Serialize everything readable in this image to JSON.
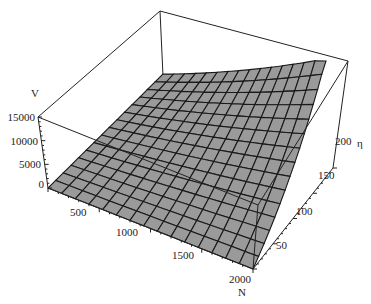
{
  "chart_data": {
    "type": "surface3d",
    "title": "",
    "xlabel": "N",
    "ylabel": "η",
    "zlabel": "V",
    "x_ticks": [
      "500",
      "1000",
      "1500",
      "2000"
    ],
    "y_ticks": [
      "50",
      "100",
      "150",
      "200"
    ],
    "z_ticks": [
      "0",
      "5000",
      "10000",
      "15000"
    ],
    "xlim": [
      0,
      2000
    ],
    "ylim": [
      0,
      200
    ],
    "zlim": [
      0,
      15000
    ],
    "grid_lines": 15,
    "surface_color": "#9a9a9a",
    "mesh_color": "#1a1a1a",
    "sample_points": [
      {
        "N": 0,
        "eta": 0,
        "V": 0
      },
      {
        "N": 2000,
        "eta": 0,
        "V": 0
      },
      {
        "N": 0,
        "eta": 200,
        "V": 300
      },
      {
        "N": 1000,
        "eta": 100,
        "V": 3800
      },
      {
        "N": 2000,
        "eta": 100,
        "V": 7500
      },
      {
        "N": 1000,
        "eta": 200,
        "V": 7500
      },
      {
        "N": 2000,
        "eta": 200,
        "V": 15000
      }
    ]
  },
  "labels": {
    "z_axis": "V",
    "x_axis": "N",
    "y_axis": "η",
    "z0": "0",
    "z1": "5000",
    "z2": "10000",
    "z3": "15000",
    "x1": "500",
    "x2": "1000",
    "x3": "1500",
    "x4": "2000",
    "y1": "50",
    "y2": "100",
    "y3": "150",
    "y4": "200"
  }
}
